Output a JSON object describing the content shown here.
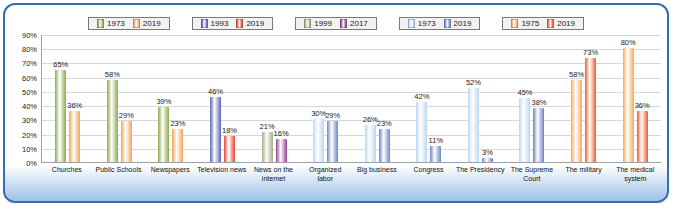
{
  "chart_data": {
    "type": "bar",
    "title": "",
    "xlabel": "",
    "ylabel": "",
    "ylim": [
      0,
      90
    ],
    "grid": true,
    "legend_position": "top",
    "ytick_labels": [
      "90%",
      "80%",
      "70%",
      "60%",
      "50%",
      "40%",
      "30%",
      "20%",
      "10%",
      "0%"
    ],
    "yticks": [
      90,
      80,
      70,
      60,
      50,
      40,
      30,
      20,
      10,
      0
    ],
    "legend_groups": [
      {
        "name": "green-orange",
        "entries": [
          {
            "label": "1973",
            "color": "#8aab4a"
          },
          {
            "label": "2019",
            "color": "#f2a356"
          }
        ]
      },
      {
        "name": "blue-red",
        "entries": [
          {
            "label": "1993",
            "color": "#5b63b5"
          },
          {
            "label": "2019",
            "color": "#e8422e"
          }
        ]
      },
      {
        "name": "olive-purple",
        "entries": [
          {
            "label": "1999",
            "color": "#a6ad84"
          },
          {
            "label": "2017",
            "color": "#8f3f94"
          }
        ]
      },
      {
        "name": "lightblue-darkblue",
        "entries": [
          {
            "label": "1973",
            "color": "#bcd8f2"
          },
          {
            "label": "2019",
            "color": "#6d84c8"
          }
        ]
      },
      {
        "name": "lightorange-red",
        "entries": [
          {
            "label": "1975",
            "color": "#f7a95a"
          },
          {
            "label": "2019",
            "color": "#ef5a2a"
          }
        ]
      }
    ],
    "categories": [
      "Churches",
      "Public Schools",
      "Newspapers",
      "Television news",
      "News on the internet",
      "Organized labor",
      "Big business",
      "Congress",
      "The Presidency",
      "The Supreme Court",
      "The military",
      "The medical system"
    ],
    "bars": [
      {
        "category": "Churches",
        "values": [
          {
            "series": "1973",
            "value": 65,
            "label": "65%",
            "color": "#8aab4a"
          },
          {
            "series": "2019",
            "value": 36,
            "label": "36%",
            "color": "#f2a356"
          }
        ]
      },
      {
        "category": "Public Schools",
        "values": [
          {
            "series": "1973",
            "value": 58,
            "label": "58%",
            "color": "#8aab4a"
          },
          {
            "series": "2019",
            "value": 29,
            "label": "29%",
            "color": "#f2a356"
          }
        ]
      },
      {
        "category": "Newspapers",
        "values": [
          {
            "series": "1973",
            "value": 39,
            "label": "39%",
            "color": "#8aab4a"
          },
          {
            "series": "2019",
            "value": 23,
            "label": "23%",
            "color": "#f2a356"
          }
        ]
      },
      {
        "category": "Television news",
        "values": [
          {
            "series": "1993",
            "value": 46,
            "label": "46%",
            "color": "#5b63b5"
          },
          {
            "series": "2019",
            "value": 18,
            "label": "18%",
            "color": "#e8422e"
          }
        ]
      },
      {
        "category": "News on the internet",
        "values": [
          {
            "series": "1999",
            "value": 21,
            "label": "21%",
            "color": "#a6ad84"
          },
          {
            "series": "2017",
            "value": 16,
            "label": "16%",
            "color": "#8f3f94"
          }
        ]
      },
      {
        "category": "Organized labor",
        "values": [
          {
            "series": "1973",
            "value": 30,
            "label": "30%",
            "color": "#bcd8f2"
          },
          {
            "series": "2019",
            "value": 29,
            "label": "29%",
            "color": "#6d84c8"
          }
        ]
      },
      {
        "category": "Big business",
        "values": [
          {
            "series": "1973",
            "value": 26,
            "label": "26%",
            "color": "#bcd8f2"
          },
          {
            "series": "2019",
            "value": 23,
            "label": "23%",
            "color": "#6d84c8"
          }
        ]
      },
      {
        "category": "Congress",
        "values": [
          {
            "series": "1973",
            "value": 42,
            "label": "42%",
            "color": "#bcd8f2"
          },
          {
            "series": "2019",
            "value": 11,
            "label": "11%",
            "color": "#6d84c8"
          }
        ]
      },
      {
        "category": "The Presidency",
        "values": [
          {
            "series": "1973",
            "value": 52,
            "label": "52%",
            "color": "#bcd8f2"
          },
          {
            "series": "2019",
            "value": 3,
            "label": "3%",
            "color": "#6d84c8"
          }
        ]
      },
      {
        "category": "The Supreme Court",
        "values": [
          {
            "series": "1973",
            "value": 45,
            "label": "45%",
            "color": "#bcd8f2"
          },
          {
            "series": "2019",
            "value": 38,
            "label": "38%",
            "color": "#6d84c8"
          }
        ]
      },
      {
        "category": "The military",
        "values": [
          {
            "series": "1975",
            "value": 58,
            "label": "58%",
            "color": "#f7a95a"
          },
          {
            "series": "2019",
            "value": 73,
            "label": "73%",
            "color": "#ef5a2a"
          }
        ]
      },
      {
        "category": "The medical system",
        "values": [
          {
            "series": "1975",
            "value": 80,
            "label": "80%",
            "color": "#f7a95a"
          },
          {
            "series": "2019",
            "value": 36,
            "label": "36%",
            "color": "#ef5a2a"
          }
        ]
      }
    ]
  }
}
